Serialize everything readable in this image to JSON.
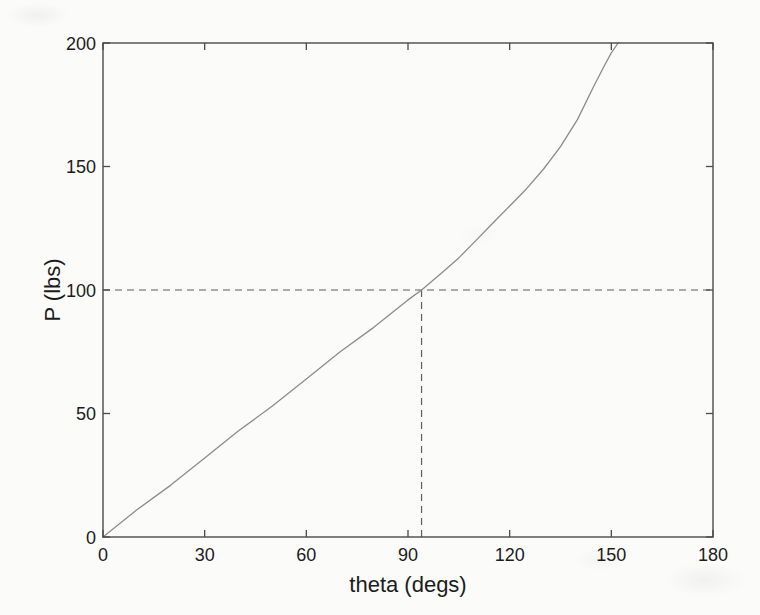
{
  "figure": {
    "background": "#fbfbfa"
  },
  "chart_data": {
    "type": "line",
    "title": "",
    "xlabel": "theta (degs)",
    "ylabel": "P (lbs)",
    "xlim": [
      0,
      180
    ],
    "ylim": [
      0,
      200
    ],
    "xticks": [
      0,
      30,
      60,
      90,
      120,
      150,
      180
    ],
    "yticks": [
      0,
      50,
      100,
      150,
      200
    ],
    "grid": false,
    "box": true,
    "colors": {
      "axis": "#4a4a4a",
      "curve": "#8c8c8c",
      "guide": "#5f5f5f",
      "text": "#1c1c1c"
    },
    "series": [
      {
        "name": "P vs theta",
        "line_style": "solid",
        "x": [
          0,
          10,
          20,
          30,
          40,
          50,
          60,
          70,
          80,
          90,
          94,
          100,
          105,
          110,
          115,
          120,
          125,
          130,
          135,
          140,
          145,
          148,
          150,
          152
        ],
        "y": [
          0,
          11,
          21,
          32,
          43,
          53,
          64,
          75,
          85,
          96,
          100,
          107,
          113,
          120,
          127,
          134,
          141,
          149,
          158,
          169,
          183,
          191,
          196,
          200
        ]
      }
    ],
    "guides": [
      {
        "orientation": "horizontal",
        "y": 100,
        "x_from": 0,
        "x_to": 180,
        "line_style": "dashed"
      },
      {
        "orientation": "vertical",
        "x": 94,
        "y_from": 0,
        "y_to": 100,
        "line_style": "dashed"
      }
    ]
  }
}
